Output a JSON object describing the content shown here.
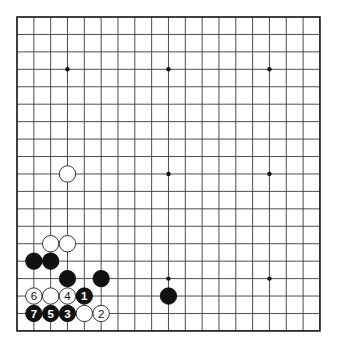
{
  "board": {
    "size": 19,
    "origin_x": 17,
    "origin_y": 17,
    "spacing_x": 16.83,
    "spacing_y": 17.44,
    "stone_radius": 8.2,
    "colors": {
      "black": "#111111",
      "white": "#ffffff",
      "line": "#3a3a3a"
    },
    "hoshi": [
      [
        3,
        3
      ],
      [
        9,
        3
      ],
      [
        15,
        3
      ],
      [
        3,
        9
      ],
      [
        9,
        9
      ],
      [
        15,
        9
      ],
      [
        3,
        15
      ],
      [
        9,
        15
      ],
      [
        15,
        15
      ]
    ]
  },
  "stones": [
    {
      "color": "white",
      "col": 3,
      "row": 9,
      "label": ""
    },
    {
      "color": "white",
      "col": 2,
      "row": 13,
      "label": ""
    },
    {
      "color": "white",
      "col": 3,
      "row": 13,
      "label": ""
    },
    {
      "color": "black",
      "col": 1,
      "row": 14,
      "label": ""
    },
    {
      "color": "black",
      "col": 2,
      "row": 14,
      "label": ""
    },
    {
      "color": "black",
      "col": 3,
      "row": 15,
      "label": ""
    },
    {
      "color": "black",
      "col": 5,
      "row": 15,
      "label": ""
    },
    {
      "color": "black",
      "col": 9,
      "row": 16,
      "label": ""
    },
    {
      "color": "white",
      "col": 1,
      "row": 16,
      "label": "6"
    },
    {
      "color": "white",
      "col": 2,
      "row": 16,
      "label": ""
    },
    {
      "color": "white",
      "col": 3,
      "row": 16,
      "label": "4"
    },
    {
      "color": "black",
      "col": 4,
      "row": 16,
      "label": "1"
    },
    {
      "color": "black",
      "col": 1,
      "row": 17,
      "label": "7"
    },
    {
      "color": "black",
      "col": 2,
      "row": 17,
      "label": "5"
    },
    {
      "color": "black",
      "col": 3,
      "row": 17,
      "label": "3"
    },
    {
      "color": "white",
      "col": 4,
      "row": 17,
      "label": ""
    },
    {
      "color": "white",
      "col": 5,
      "row": 17,
      "label": "2"
    }
  ]
}
